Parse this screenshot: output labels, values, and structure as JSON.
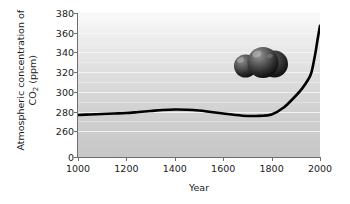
{
  "chart_data": {
    "type": "line",
    "title": "",
    "subtitle": "",
    "xlabel": "Year",
    "ylabel_line1": "Atmospheric concentration of",
    "ylabel_line2_pre": "CO",
    "ylabel_line2_sub": "2",
    "ylabel_line2_post": " (ppm)",
    "ylabel_plain": "Atmospheric concentration of CO2 (ppm)",
    "xticks": [
      1000,
      1200,
      1400,
      1600,
      1800,
      2000
    ],
    "xtick_labels": [
      "1000",
      "1200",
      "1400",
      "1600",
      "1800",
      "2000"
    ],
    "yticks": [
      380,
      360,
      340,
      320,
      300,
      280,
      260,
      0
    ],
    "ytick_labels": [
      "380",
      "360",
      "340",
      "320",
      "300",
      "280",
      "260",
      "0"
    ],
    "xlim": [
      1000,
      2000
    ],
    "ylim": [
      250,
      380
    ],
    "axis_break": true,
    "grid": true,
    "grid_orientation": "horizontal",
    "grid_color": "#f4f4f4",
    "legend": null,
    "line_color": "#000000",
    "line_width": 2.6,
    "plot_background": "light-gray vertical gradient",
    "x": [
      1000,
      1050,
      1100,
      1150,
      1200,
      1250,
      1300,
      1350,
      1400,
      1450,
      1500,
      1550,
      1600,
      1650,
      1700,
      1750,
      1800,
      1850,
      1900,
      1925,
      1950,
      1965,
      1980,
      1990,
      2000
    ],
    "values": [
      276.5,
      277,
      277.5,
      278,
      278.5,
      279.5,
      280.5,
      281.5,
      282,
      281.8,
      281,
      279.5,
      278,
      276.5,
      275.5,
      275.6,
      277,
      284,
      296,
      303,
      312,
      320,
      338,
      353,
      367
    ],
    "series": [
      {
        "name": "Atmospheric CO2 concentration",
        "values": [
          276.5,
          277,
          277.5,
          278,
          278.5,
          279.5,
          280.5,
          281.5,
          282,
          281.8,
          281,
          279.5,
          278,
          276.5,
          275.5,
          275.6,
          277,
          284,
          296,
          303,
          312,
          320,
          338,
          353,
          367
        ]
      }
    ],
    "annotations": [
      {
        "name": "co2-molecule-illustration",
        "type": "image",
        "description": "3D ball-and-stick style model of a carbon dioxide molecule (three dark gray spheres)",
        "x_year": 1720,
        "y_ppm": 335
      }
    ]
  }
}
